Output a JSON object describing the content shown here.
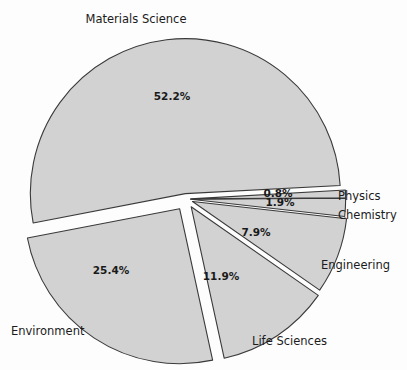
{
  "chart_data": {
    "type": "pie",
    "title": "",
    "subtitle": "",
    "xlabel": "",
    "ylabel": "",
    "legend_position": "outside-labels",
    "grid": false,
    "categories": [
      "Materials Science",
      "Environment",
      "Life Sciences",
      "Engineering",
      "Chemistry",
      "Physics"
    ],
    "values": [
      52.2,
      25.4,
      11.9,
      7.9,
      1.9,
      0.8
    ],
    "value_labels": [
      "52.2%",
      "25.4%",
      "11.9%",
      "7.9%",
      "1.9%",
      "0.8%"
    ],
    "units": "percent",
    "exploded": true,
    "slice_fill": "#d2d2d2",
    "slice_stroke": "#3a3a3a",
    "background": "#fdfdfd",
    "slices": [
      {
        "name": "Materials Science",
        "value": 52.2,
        "value_label": "52.2%",
        "category_label": "Materials Science",
        "start_angle_deg": 3.0,
        "sweep_deg": 187.9,
        "explode": 0.035,
        "pct_label_x": 172,
        "pct_label_y": 97,
        "cat_label_x": 136,
        "cat_label_y": 19,
        "cat_anchor": "anchor-middle"
      },
      {
        "name": "Environment",
        "value": 25.4,
        "value_label": "25.4%",
        "category_label": "Environment",
        "start_angle_deg": 190.9,
        "sweep_deg": 91.4,
        "explode": 0.075,
        "pct_label_x": 111,
        "pct_label_y": 271,
        "cat_label_x": 11,
        "cat_label_y": 331,
        "cat_anchor": "anchor-start"
      },
      {
        "name": "Life Sciences",
        "value": 11.9,
        "value_label": "11.9%",
        "category_label": "Life Sciences",
        "start_angle_deg": 282.3,
        "sweep_deg": 42.8,
        "explode": 0.06,
        "pct_label_x": 221,
        "pct_label_y": 277,
        "cat_label_x": 252,
        "cat_label_y": 341,
        "cat_anchor": "anchor-start"
      },
      {
        "name": "Engineering",
        "value": 7.9,
        "value_label": "7.9%",
        "category_label": "Engineering",
        "start_angle_deg": 325.1,
        "sweep_deg": 28.5,
        "explode": 0.045,
        "pct_label_x": 256,
        "pct_label_y": 233,
        "cat_label_x": 321,
        "cat_label_y": 265,
        "cat_anchor": "anchor-start"
      },
      {
        "name": "Chemistry",
        "value": 1.9,
        "value_label": "1.9%",
        "category_label": "Chemistry",
        "start_angle_deg": 353.6,
        "sweep_deg": 6.8,
        "explode": 0.03,
        "pct_label_x": 280,
        "pct_label_y": 203,
        "cat_label_x": 338,
        "cat_label_y": 215,
        "cat_anchor": "anchor-start"
      },
      {
        "name": "Physics",
        "value": 0.8,
        "value_label": "0.8%",
        "category_label": "Physics",
        "start_angle_deg": 0.4,
        "sweep_deg": 2.9,
        "explode": 0.03,
        "pct_label_x": 278,
        "pct_label_y": 194,
        "cat_label_x": 338,
        "cat_label_y": 196,
        "cat_anchor": "anchor-start"
      }
    ],
    "geometry": {
      "center_x": 186,
      "center_y": 199,
      "radius": 155
    }
  }
}
